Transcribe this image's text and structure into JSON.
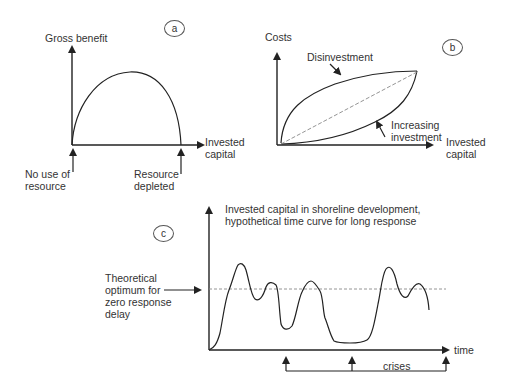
{
  "panels": {
    "a": {
      "badge": "a",
      "y_label": "Gross benefit",
      "x_label_line1": "Invested",
      "x_label_line2": "capital",
      "left_note_line1": "No use of",
      "left_note_line2": "resource",
      "right_note_line1": "Resource",
      "right_note_line2": "depleted"
    },
    "b": {
      "badge": "b",
      "y_label": "Costs",
      "x_label_line1": "Invested",
      "x_label_line2": "capital",
      "upper_curve_label": "Disinvestment",
      "lower_curve_label_line1": "Increasing",
      "lower_curve_label_line2": "investment"
    },
    "c": {
      "badge": "c",
      "title_line1": "Invested capital in shoreline development,",
      "title_line2": "hypothetical time curve for long response",
      "optimum_line1": "Theoretical",
      "optimum_line2": "optimum for",
      "optimum_line3": "zero response",
      "optimum_line4": "delay",
      "x_label": "time",
      "crises_label": "crises"
    }
  },
  "colors": {
    "line": "#222222",
    "dashed": "#888888",
    "text": "#333333"
  }
}
